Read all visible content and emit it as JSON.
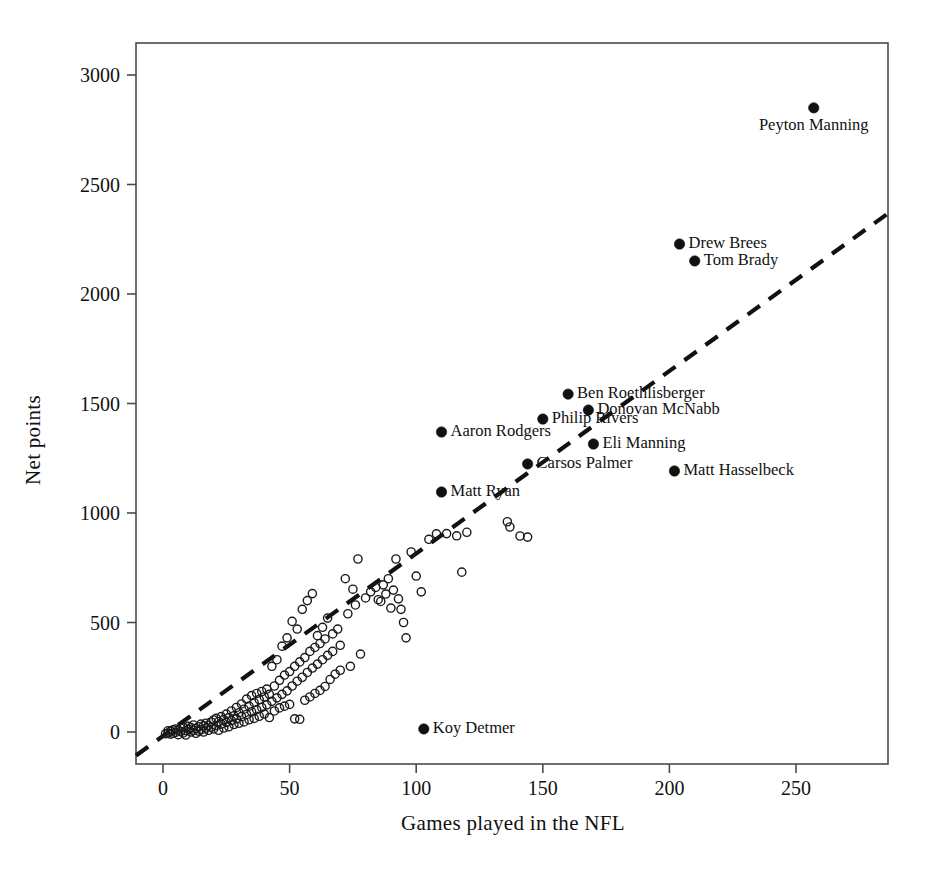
{
  "chart_data": {
    "type": "scatter",
    "title": "",
    "xlabel": "Games played in the NFL",
    "ylabel": "Net points",
    "xlim": [
      -11,
      286
    ],
    "ylim": [
      -146,
      3290
    ],
    "xticks": [
      0,
      50,
      100,
      150,
      200,
      250
    ],
    "xticklabels": [
      "0",
      "50",
      "100",
      "150",
      "200",
      "250"
    ],
    "yticks": [
      0,
      500,
      1000,
      1500,
      2000,
      2500,
      3000
    ],
    "yticklabels": [
      "0",
      "500",
      "1000",
      "1500",
      "2000",
      "2500",
      "3000"
    ],
    "grid": false,
    "legend": null,
    "marker_unlabeled": "open-circle",
    "marker_labeled": "filled-circle",
    "trendline": {
      "style": "dashed",
      "x": [
        -11,
        286
      ],
      "y": [
        -110,
        2365
      ]
    },
    "labeled_points": [
      {
        "label": "Peyton Manning",
        "x": 257,
        "y": 2850,
        "label_pos": "below"
      },
      {
        "label": "Drew Brees",
        "x": 204,
        "y": 2228,
        "label_pos": "right"
      },
      {
        "label": "Tom Brady",
        "x": 210,
        "y": 2151,
        "label_pos": "right"
      },
      {
        "label": "Ben Roethlisberger",
        "x": 160,
        "y": 1543,
        "label_pos": "right"
      },
      {
        "label": "Donovan McNabb",
        "x": 168,
        "y": 1470,
        "label_pos": "right"
      },
      {
        "label": "Philip Rivers",
        "x": 150,
        "y": 1429,
        "label_pos": "right"
      },
      {
        "label": "Aaron Rodgers",
        "x": 110,
        "y": 1370,
        "label_pos": "right"
      },
      {
        "label": "Eli Manning",
        "x": 170,
        "y": 1315,
        "label_pos": "right"
      },
      {
        "label": "Carsos Palmer",
        "x": 144,
        "y": 1224,
        "label_pos": "right"
      },
      {
        "label": "Matt Hasselbeck",
        "x": 202,
        "y": 1192,
        "label_pos": "right"
      },
      {
        "label": "Matt Ryan",
        "x": 110,
        "y": 1096,
        "label_pos": "right"
      },
      {
        "label": "Koy Detmer",
        "x": 103,
        "y": 14,
        "label_pos": "right"
      }
    ],
    "unlabeled_points": [
      [
        1,
        -8
      ],
      [
        2,
        -5
      ],
      [
        2,
        6
      ],
      [
        3,
        -10
      ],
      [
        3,
        4
      ],
      [
        4,
        -6
      ],
      [
        4,
        10
      ],
      [
        5,
        -2
      ],
      [
        5,
        14
      ],
      [
        6,
        -12
      ],
      [
        6,
        8
      ],
      [
        7,
        2
      ],
      [
        7,
        18
      ],
      [
        8,
        -4
      ],
      [
        8,
        22
      ],
      [
        9,
        6
      ],
      [
        9,
        -14
      ],
      [
        10,
        12
      ],
      [
        10,
        26
      ],
      [
        11,
        0
      ],
      [
        11,
        20
      ],
      [
        12,
        8
      ],
      [
        12,
        32
      ],
      [
        13,
        -6
      ],
      [
        13,
        16
      ],
      [
        14,
        24
      ],
      [
        14,
        4
      ],
      [
        15,
        36
      ],
      [
        15,
        10
      ],
      [
        16,
        28
      ],
      [
        16,
        0
      ],
      [
        17,
        40
      ],
      [
        17,
        18
      ],
      [
        18,
        30
      ],
      [
        18,
        8
      ],
      [
        19,
        46
      ],
      [
        19,
        22
      ],
      [
        20,
        55
      ],
      [
        20,
        14
      ],
      [
        21,
        62
      ],
      [
        21,
        30
      ],
      [
        22,
        48
      ],
      [
        22,
        8
      ],
      [
        23,
        70
      ],
      [
        23,
        36
      ],
      [
        24,
        58
      ],
      [
        24,
        18
      ],
      [
        25,
        82
      ],
      [
        25,
        44
      ],
      [
        26,
        66
      ],
      [
        26,
        24
      ],
      [
        27,
        96
      ],
      [
        27,
        52
      ],
      [
        28,
        74
      ],
      [
        28,
        34
      ],
      [
        29,
        112
      ],
      [
        29,
        60
      ],
      [
        30,
        88
      ],
      [
        30,
        40
      ],
      [
        31,
        128
      ],
      [
        31,
        70
      ],
      [
        32,
        104
      ],
      [
        32,
        46
      ],
      [
        33,
        150
      ],
      [
        33,
        80
      ],
      [
        34,
        118
      ],
      [
        34,
        56
      ],
      [
        35,
        166
      ],
      [
        35,
        92
      ],
      [
        36,
        134
      ],
      [
        36,
        62
      ],
      [
        37,
        176
      ],
      [
        37,
        102
      ],
      [
        38,
        148
      ],
      [
        38,
        72
      ],
      [
        39,
        185
      ],
      [
        39,
        112
      ],
      [
        40,
        160
      ],
      [
        40,
        82
      ],
      [
        41,
        196
      ],
      [
        41,
        124
      ],
      [
        42,
        172
      ],
      [
        42,
        66
      ],
      [
        43,
        300
      ],
      [
        43,
        140
      ],
      [
        44,
        210
      ],
      [
        44,
        96
      ],
      [
        45,
        330
      ],
      [
        45,
        156
      ],
      [
        46,
        236
      ],
      [
        46,
        110
      ],
      [
        47,
        392
      ],
      [
        47,
        172
      ],
      [
        48,
        260
      ],
      [
        48,
        118
      ],
      [
        49,
        430
      ],
      [
        49,
        188
      ],
      [
        50,
        276
      ],
      [
        50,
        126
      ],
      [
        51,
        505
      ],
      [
        51,
        210
      ],
      [
        52,
        300
      ],
      [
        52,
        60
      ],
      [
        53,
        470
      ],
      [
        53,
        232
      ],
      [
        54,
        320
      ],
      [
        54,
        58
      ],
      [
        55,
        560
      ],
      [
        55,
        250
      ],
      [
        56,
        340
      ],
      [
        56,
        145
      ],
      [
        57,
        600
      ],
      [
        57,
        272
      ],
      [
        58,
        368
      ],
      [
        58,
        160
      ],
      [
        59,
        632
      ],
      [
        59,
        292
      ],
      [
        60,
        386
      ],
      [
        60,
        176
      ],
      [
        61,
        440
      ],
      [
        61,
        310
      ],
      [
        62,
        404
      ],
      [
        62,
        190
      ],
      [
        63,
        478
      ],
      [
        63,
        330
      ],
      [
        64,
        425
      ],
      [
        64,
        208
      ],
      [
        65,
        520
      ],
      [
        65,
        350
      ],
      [
        66,
        240
      ],
      [
        67,
        448
      ],
      [
        67,
        368
      ],
      [
        68,
        264
      ],
      [
        69,
        470
      ],
      [
        70,
        396
      ],
      [
        70,
        282
      ],
      [
        72,
        700
      ],
      [
        73,
        540
      ],
      [
        74,
        300
      ],
      [
        75,
        652
      ],
      [
        76,
        580
      ],
      [
        77,
        790
      ],
      [
        78,
        356
      ],
      [
        80,
        612
      ],
      [
        82,
        640
      ],
      [
        84,
        660
      ],
      [
        85,
        604
      ],
      [
        86,
        596
      ],
      [
        87,
        672
      ],
      [
        88,
        630
      ],
      [
        89,
        700
      ],
      [
        90,
        566
      ],
      [
        91,
        648
      ],
      [
        92,
        790
      ],
      [
        93,
        608
      ],
      [
        94,
        560
      ],
      [
        95,
        500
      ],
      [
        96,
        430
      ],
      [
        98,
        822
      ],
      [
        100,
        712
      ],
      [
        102,
        640
      ],
      [
        105,
        880
      ],
      [
        108,
        905
      ],
      [
        112,
        906
      ],
      [
        116,
        896
      ],
      [
        118,
        730
      ],
      [
        120,
        912
      ],
      [
        136,
        960
      ],
      [
        137,
        936
      ],
      [
        141,
        895
      ],
      [
        144,
        890
      ]
    ]
  },
  "figure": {
    "background": "#ffffff",
    "axis_color": "#4a4a4a",
    "marker_color": "#1a1a1a"
  }
}
